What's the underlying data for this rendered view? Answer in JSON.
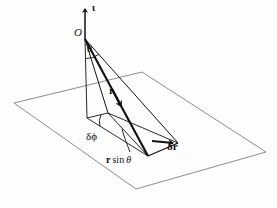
{
  "figure": {
    "background_color": "#fdfdfd",
    "ink_color": "#111111",
    "plane_line_color": "#6f6f6f",
    "width": 277,
    "height": 208
  },
  "labels": {
    "axis_unit_vector": "ι",
    "origin": "O",
    "polar_angle": "θ",
    "radius_vector": "r",
    "delta_phi": "δϕ",
    "delta_r": "δr",
    "r_sin_theta_bold": "r",
    "r_sin_theta_rest": " sin ",
    "r_sin_theta_theta": "θ"
  },
  "geometry": {
    "origin_point": [
      85,
      39
    ],
    "axis_arrow_tip": [
      85,
      6
    ],
    "axis_arrow_base": [
      85,
      39
    ],
    "plane_corners": [
      [
        14,
        103
      ],
      [
        142,
        72
      ],
      [
        266,
        152
      ],
      [
        136,
        189
      ]
    ],
    "vertical_drop_base": [
      87,
      118
    ],
    "r_vector_tip": [
      148,
      156
    ],
    "patch_vertices": [
      [
        87,
        118
      ],
      [
        148,
        156
      ],
      [
        178,
        143
      ],
      [
        108,
        113
      ]
    ],
    "delta_r_arrow_from": [
      155,
      143
    ],
    "delta_r_arrow_to": [
      176,
      144
    ],
    "theta_arc_radius": 19,
    "delta_phi_arc_radius": 16
  },
  "label_positions": {
    "axis_unit_vector": [
      92,
      4
    ],
    "origin": [
      75,
      28
    ],
    "polar_angle": [
      87,
      44
    ],
    "radius_vector": [
      110,
      90
    ],
    "delta_phi": [
      89,
      135
    ],
    "delta_r": [
      168,
      145
    ],
    "r_sin_theta": [
      110,
      159
    ]
  }
}
